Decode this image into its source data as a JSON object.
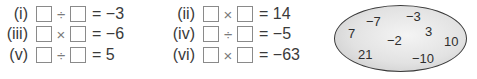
{
  "equations": [
    {
      "label": "(i)",
      "op": "÷",
      "rhs": "= −3"
    },
    {
      "label": "(ii)",
      "op": "×",
      "rhs": "= 14"
    },
    {
      "label": "(iii)",
      "op": "×",
      "rhs": "= −6"
    },
    {
      "label": "(iv)",
      "op": "÷",
      "rhs": "= −5"
    },
    {
      "label": "(v)",
      "op": "÷",
      "rhs": "= 5"
    },
    {
      "label": "(vi)",
      "op": "×",
      "rhs": "= −63"
    }
  ],
  "number_set": {
    "numbers": [
      "−7",
      "−3",
      "7",
      "−2",
      "3",
      "10",
      "21",
      "−10"
    ],
    "colors": {
      "border": "#3a3a3a",
      "fill_center": "#f4f4f4",
      "fill_edge": "#c4c4c4"
    }
  }
}
